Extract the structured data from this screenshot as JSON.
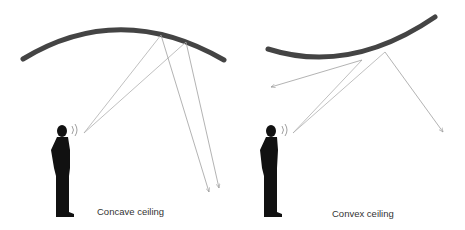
{
  "panels": [
    {
      "id": "concave",
      "caption": "Concave ceiling",
      "ceiling_shape": "concave",
      "ceiling_color": "#444444",
      "ray_color": "#aaaaaa"
    },
    {
      "id": "convex",
      "caption": "Convex ceiling",
      "ceiling_shape": "convex",
      "ceiling_color": "#444444",
      "ray_color": "#aaaaaa"
    }
  ],
  "icons": {
    "speaker": "person-silhouette-icon",
    "sound": "sound-waves-icon"
  }
}
